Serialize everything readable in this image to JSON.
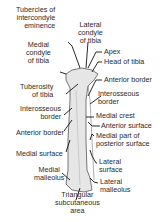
{
  "diagram": {
    "labels_left": [
      {
        "id": "tubercles",
        "text": "Tubercles of\nintercondyle\neminence"
      },
      {
        "id": "medial-condyle",
        "text": "Medial\ncondyle\nof tibia"
      },
      {
        "id": "tuberosity",
        "text": "Tuberosity\nof tibia"
      },
      {
        "id": "interosseous-left",
        "text": "Interosseous\nborder"
      },
      {
        "id": "anterior-border-left",
        "text": "Anterior border"
      },
      {
        "id": "medial-surface",
        "text": "Medial surface"
      },
      {
        "id": "medial-malleolus",
        "text": "Medial\nmalleolus"
      }
    ],
    "labels_right": [
      {
        "id": "lateral-condyle",
        "text": "Lateral\ncondyle\nof tibia"
      },
      {
        "id": "apex",
        "text": "Apex"
      },
      {
        "id": "head",
        "text": "Head of tibia"
      },
      {
        "id": "anterior-border-right",
        "text": "Anterior border"
      },
      {
        "id": "interosseous-right",
        "text": "Interosseous\nborder"
      },
      {
        "id": "medial-crest",
        "text": "Medial crest"
      },
      {
        "id": "anterior-surface",
        "text": "Anterior surface"
      },
      {
        "id": "medial-posterior",
        "text": "Medial part of\nposterior surface"
      },
      {
        "id": "lateral-surface",
        "text": "Lateral\nsurface"
      },
      {
        "id": "lateral-malleolus",
        "text": "Lateral\nmalleolus"
      }
    ],
    "labels_bottom": [
      {
        "id": "triangular",
        "text": "Triangular\nsubcutaneous\narea"
      }
    ],
    "colors": {
      "bone_fill": "#e6e6e6",
      "bone_outline": "#555555",
      "leader": "#111111",
      "text": "#2a2a2a"
    }
  }
}
